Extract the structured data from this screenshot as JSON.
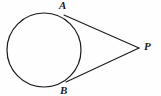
{
  "figure": {
    "kind": "geometry-diagram",
    "width": 161,
    "height": 96,
    "background_color": "#fefefe",
    "stroke_color": "#1a1a1a"
  },
  "labels": {
    "a": "A",
    "b": "B",
    "p": "P"
  },
  "geometry": {
    "circle": {
      "cx": 44,
      "cy": 50,
      "r": 37
    },
    "point_a": {
      "x": 64,
      "y": 15
    },
    "point_b": {
      "x": 66,
      "y": 82
    },
    "point_p": {
      "x": 139,
      "y": 48
    },
    "tangent_upper": {
      "x1": 64,
      "y1": 15,
      "x2": 139,
      "y2": 48
    },
    "tangent_lower": {
      "x1": 66,
      "y1": 82,
      "x2": 139,
      "y2": 48
    }
  }
}
